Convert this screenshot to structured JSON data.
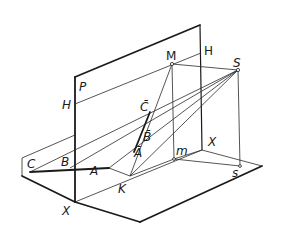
{
  "diagram": {
    "title": "",
    "type": "descriptive-geometry-projection",
    "labels": {
      "plane_P": "P",
      "trace_H_left": "H",
      "trace_H_right": "H",
      "axis_X_bottom": "X",
      "axis_X_right": "X",
      "point_M": "M",
      "point_S": "S",
      "point_m": "m",
      "point_s": "s",
      "point_C": "C",
      "point_B": "B",
      "point_A": "A",
      "point_K": "K",
      "point_C_bar": "C̄",
      "point_B_bar": "B̄",
      "point_A_bar": "Ā"
    },
    "colors": {
      "ink": "#1a1a1a",
      "background": "#ffffff"
    }
  }
}
